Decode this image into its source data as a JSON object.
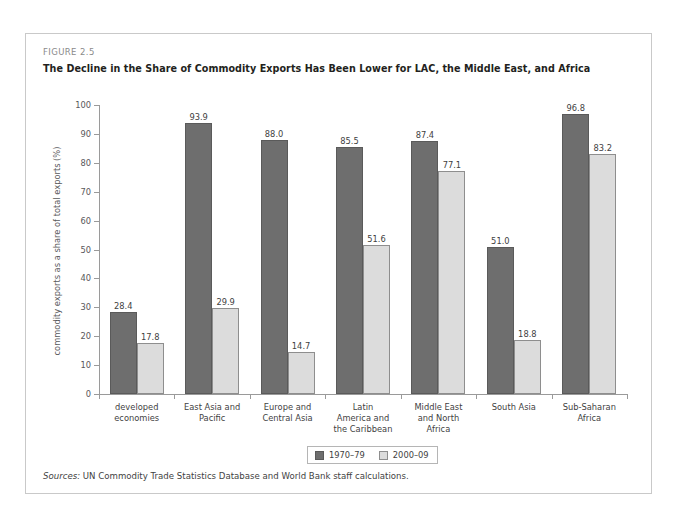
{
  "figure": {
    "number": "FIGURE 2.5",
    "title": "The Decline in the Share of Commodity Exports Has Been Lower for LAC, the Middle East, and Africa",
    "sources_label": "Sources:",
    "sources_text": " UN Commodity Trade Statistics Database and World Bank staff calculations."
  },
  "colors": {
    "series_1970_79": "#6e6e6e",
    "series_2000_09": "#dcdcdc",
    "axis": "#9a9a9a",
    "frame": "#c9c9c9",
    "text": "#3f3f3f"
  },
  "chart_data": {
    "type": "bar",
    "title": "The Decline in the Share of Commodity Exports Has Been Lower for LAC, the Middle East, and Africa",
    "xlabel": "",
    "ylabel": "commodity exports as a share of total exports (%)",
    "ylim": [
      0,
      100
    ],
    "yticks": [
      0,
      10,
      20,
      30,
      40,
      50,
      60,
      70,
      80,
      90,
      100
    ],
    "ytick_labels": [
      "0",
      "10",
      "20",
      "30",
      "40",
      "50",
      "60",
      "70",
      "80",
      "90",
      "100"
    ],
    "grid": false,
    "legend_position": "bottom-center",
    "categories": [
      "developed economies",
      "East Asia and Pacific",
      "Europe and Central Asia",
      "Latin America and the Caribbean",
      "Middle East and North Africa",
      "South Asia",
      "Sub-Saharan Africa"
    ],
    "category_lines": [
      [
        "developed",
        "economies"
      ],
      [
        "East Asia and",
        "Pacific"
      ],
      [
        "Europe and",
        "Central Asia"
      ],
      [
        "Latin",
        "America and",
        "the Caribbean"
      ],
      [
        "Middle East",
        "and North",
        "Africa"
      ],
      [
        "South Asia"
      ],
      [
        "Sub-Saharan",
        "Africa"
      ]
    ],
    "series": [
      {
        "name": "1970–79",
        "values": [
          28.4,
          93.9,
          88.0,
          85.5,
          87.4,
          51.0,
          96.8
        ],
        "labels": [
          "28.4",
          "93.9",
          "88.0",
          "85.5",
          "87.4",
          "51.0",
          "96.8"
        ]
      },
      {
        "name": "2000–09",
        "values": [
          17.8,
          29.9,
          14.7,
          51.6,
          77.1,
          18.8,
          83.2
        ],
        "labels": [
          "17.8",
          "29.9",
          "14.7",
          "51.6",
          "77.1",
          "18.8",
          "83.2"
        ]
      }
    ]
  }
}
